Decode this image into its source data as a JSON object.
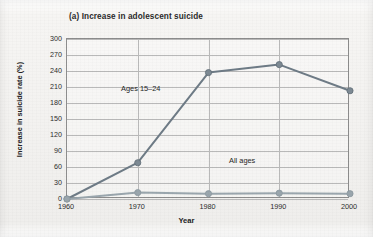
{
  "figure": {
    "title": "(a) Increase in adolescent suicide",
    "xlabel": "Year",
    "ylabel": "Increase in suicide rate (%)"
  },
  "annotations": {
    "teen": "Ages 15–24",
    "all": "All ages"
  },
  "colors": {
    "teen_line": "#6e7b86",
    "all_line": "#9aa6ad",
    "marker": "#7d8a94",
    "grid": "#b9b9b9",
    "frame": "#8d8d8d",
    "text": "#2c2c2c",
    "background": "#f3f2f0"
  },
  "chart_data": {
    "type": "line",
    "title": "(a) Increase in adolescent suicide",
    "xlabel": "Year",
    "ylabel": "Increase in suicide rate (%)",
    "x": [
      1960,
      1970,
      1980,
      1990,
      2000
    ],
    "xticklabels": [
      "1960",
      "1970",
      "1980",
      "1990",
      "2000"
    ],
    "yticks": [
      0,
      30,
      60,
      90,
      120,
      150,
      180,
      210,
      240,
      270,
      300
    ],
    "yticklabels": [
      "0",
      "30",
      "60",
      "90",
      "120",
      "150",
      "180",
      "210",
      "240",
      "270",
      "300"
    ],
    "xlim": [
      1960,
      2000
    ],
    "ylim": [
      0,
      300
    ],
    "grid": true,
    "legend": "none",
    "series": [
      {
        "name": "Ages 15–24",
        "label_position": "inline-annotation",
        "values": [
          0,
          68,
          237,
          252,
          203
        ]
      },
      {
        "name": "All ages",
        "label_position": "inline-annotation",
        "values": [
          0,
          12,
          10,
          11,
          10
        ]
      }
    ]
  }
}
